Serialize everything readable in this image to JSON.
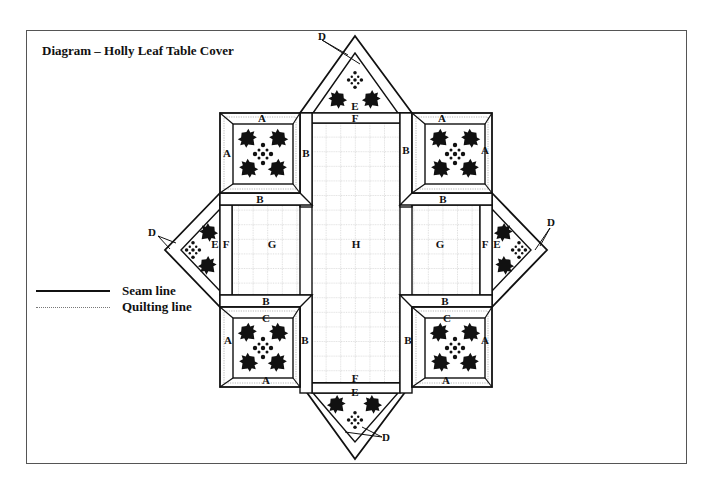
{
  "title": "Diagram – Holly Leaf Table Cover",
  "legend": {
    "items": [
      {
        "label": "Seam line",
        "style": "solid"
      },
      {
        "label": "Quilting line",
        "style": "dotted"
      }
    ]
  },
  "pieces": {
    "A": "A",
    "B": "B",
    "C": "C",
    "D": "D",
    "E": "E",
    "F": "F",
    "G": "G",
    "H": "H"
  },
  "colors": {
    "line": "#111111",
    "quilt": "#8a8a8a",
    "leaf": "#111111",
    "background": "#ffffff"
  }
}
